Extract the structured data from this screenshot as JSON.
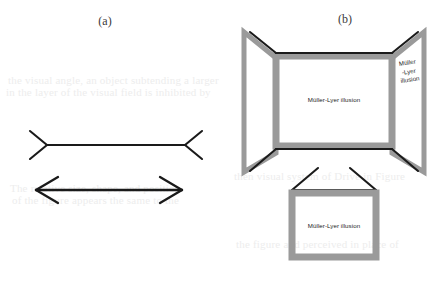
{
  "figure": {
    "panels": [
      {
        "caption": "(a)",
        "name": "muller-lyer-line-figures",
        "items": [
          {
            "name": "fins-outward-figure",
            "description": "horizontal line with outward-pointing fins"
          },
          {
            "name": "double-headed-arrow-figure",
            "description": "horizontal line with inward-pointing arrowheads"
          }
        ]
      },
      {
        "caption": "(b)",
        "name": "muller-lyer-three-dimensional-book-figures",
        "labels": {
          "center_panel": "Müller-Lyer illusion",
          "right_panel_line1": "Müller",
          "right_panel_line2": "-Lyer",
          "right_panel_line3": "illusion",
          "bottom_panel": "Müller-Lyer illusion"
        }
      }
    ]
  },
  "colors": {
    "frame_gray": "#9a9a9a",
    "line_black": "#1a1a1a",
    "caption_gray": "#3a3a3a",
    "page_white": "#ffffff",
    "ghost_gray": "#ededed"
  },
  "ghost_text": {
    "lines": [
      "the visual angle, an object subtending a larger",
      "in the layer of the visual field is inhibited by",
      "The relative size, shape, and position",
      "of the figure appears the same to the",
      "then visual system of Drive in Figure",
      "the figure and perceived in place of"
    ]
  }
}
